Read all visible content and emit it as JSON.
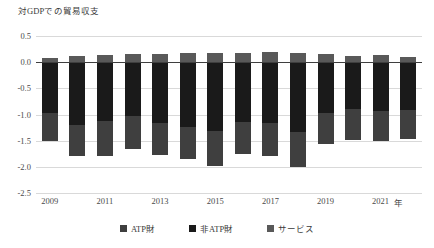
{
  "chart_data": {
    "type": "bar",
    "title": "対GDPでの貿易収支",
    "xlabel": "年",
    "ylabel": "",
    "ylim": [
      -2.5,
      0.5
    ],
    "yticks": [
      "0.5",
      "0.0",
      "-0.5",
      "-1.0",
      "-1.5",
      "-2.0",
      "-2.5"
    ],
    "ytick_values": [
      0.5,
      0.0,
      -0.5,
      -1.0,
      -1.5,
      -2.0,
      -2.5
    ],
    "grid": true,
    "stacked": true,
    "legend_position": "bottom",
    "categories": [
      2009,
      2010,
      2011,
      2012,
      2013,
      2014,
      2015,
      2016,
      2017,
      2018,
      2019,
      2020,
      2021,
      2022
    ],
    "xtick_labels": [
      "2009",
      "2011",
      "2013",
      "2015",
      "2017",
      "2019",
      "2021"
    ],
    "xtick_categories": [
      2009,
      2011,
      2013,
      2015,
      2017,
      2019,
      2021
    ],
    "x_unit_label": "年",
    "series": [
      {
        "name": "ATP財",
        "color": "#3f3f3f",
        "values": [
          -0.53,
          -0.6,
          -0.66,
          -0.63,
          -0.61,
          -0.62,
          -0.66,
          -0.6,
          -0.63,
          -0.66,
          -0.6,
          -0.58,
          -0.57,
          -0.55
        ]
      },
      {
        "name": "非ATP財",
        "color": "#1a1a1a",
        "values": [
          -0.97,
          -1.2,
          -1.13,
          -1.03,
          -1.16,
          -1.24,
          -1.32,
          -1.15,
          -1.17,
          -1.34,
          -0.97,
          -0.9,
          -0.93,
          -0.92
        ]
      },
      {
        "name": "サービス",
        "color": "#595959",
        "values": [
          0.09,
          0.11,
          0.13,
          0.15,
          0.16,
          0.17,
          0.18,
          0.18,
          0.19,
          0.18,
          0.15,
          0.12,
          0.13,
          0.1
        ]
      }
    ],
    "totals": [
      -1.5,
      -1.8,
      -1.79,
      -1.66,
      -1.77,
      -1.86,
      -1.98,
      -1.75,
      -1.8,
      -2.0,
      -1.57,
      -1.48,
      -1.5,
      -1.47
    ]
  },
  "legend": {
    "items": [
      {
        "label": "ATP財",
        "color": "#3f3f3f",
        "name": "legend-item-atp"
      },
      {
        "label": "非ATP財",
        "color": "#1a1a1a",
        "name": "legend-item-non-atp"
      },
      {
        "label": "サービス",
        "color": "#595959",
        "name": "legend-item-services"
      }
    ]
  },
  "colors": {
    "background": "#ffffff",
    "gridline": "#d9d9d9",
    "zero_axis": "#3f3f3f",
    "text": "#3a3a3a"
  }
}
